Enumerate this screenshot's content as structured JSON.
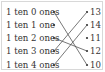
{
  "left_items": [
    {
      "label": "1 ten 0 ones",
      "y": 12
    },
    {
      "label": "1 ten 1 one",
      "y": 25
    },
    {
      "label": "1 ten 2 ones",
      "y": 38
    },
    {
      "label": "1 ten 3 ones",
      "y": 51
    },
    {
      "label": "1 ten 4 ones",
      "y": 65
    }
  ],
  "right_items": [
    {
      "label": "13",
      "y": 12
    },
    {
      "label": "14",
      "y": 25
    },
    {
      "label": "11",
      "y": 38
    },
    {
      "label": "12",
      "y": 51
    },
    {
      "label": "10",
      "y": 65
    }
  ],
  "connections": [
    {
      "from": "1 ten 0 ones",
      "to": "10"
    },
    {
      "from": "1 ten 2 ones",
      "to": "12"
    },
    {
      "from": "1 ten 3 ones",
      "to": "13"
    },
    {
      "from": "1 ten 4 ones",
      "to": "14"
    }
  ],
  "colors": {
    "line": "#555555",
    "dot": "#333333",
    "border": "#d8d8d8"
  }
}
